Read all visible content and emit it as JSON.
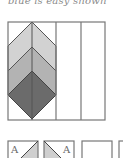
{
  "caption": "blue is easy shown",
  "main_diagram": {
    "columns": 4,
    "shapes": [
      {
        "name": "top-chevron",
        "fill": "#d2d2d2"
      },
      {
        "name": "middle-chevron",
        "fill": "#b3b3b3"
      },
      {
        "name": "bottom-diamond",
        "fill": "#6b6b6b"
      }
    ],
    "stroke": "#555555"
  },
  "tiles": [
    {
      "label": "A",
      "shading": "lower-right",
      "fill": "#cfcfcf"
    },
    {
      "label": "A",
      "shading": "lower-left",
      "fill": "#cfcfcf"
    },
    {
      "label": "",
      "shading": "none"
    },
    {
      "label": "",
      "shading": "none"
    }
  ]
}
